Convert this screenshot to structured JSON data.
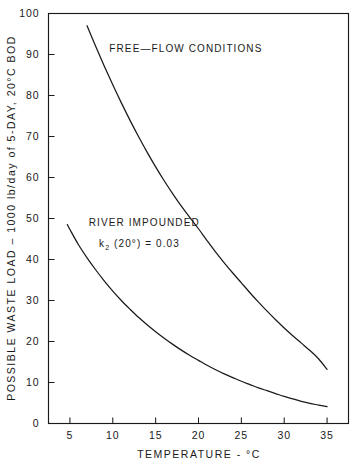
{
  "chart_data": {
    "type": "line",
    "title": "",
    "xlabel": "TEMPERATURE - °C",
    "ylabel": "POSSIBLE WASTE LOAD – 1000 lb/day of 5-DAY, 20°C BOD",
    "xlim": [
      2.5,
      37.5
    ],
    "ylim": [
      0,
      100
    ],
    "grid": false,
    "legend_position": "inline-annotations",
    "xticks": [
      5,
      10,
      15,
      20,
      25,
      30,
      35
    ],
    "xtick_labels": [
      "5",
      "10",
      "15",
      "20",
      "25",
      "30",
      "35"
    ],
    "yticks": [
      0,
      10,
      20,
      30,
      40,
      50,
      60,
      70,
      80,
      90,
      100
    ],
    "ytick_labels": [
      "0",
      "10",
      "20",
      "30",
      "40",
      "50",
      "60",
      "70",
      "80",
      "90",
      "100"
    ],
    "series": [
      {
        "name": "FREE-FLOW CONDITIONS",
        "x": [
          7,
          8,
          9,
          10,
          11,
          12,
          13,
          14,
          15,
          16,
          17,
          18,
          19,
          20,
          21,
          22,
          23,
          24,
          25,
          26,
          27,
          28,
          29,
          30,
          31,
          32,
          33,
          34,
          35
        ],
        "values": [
          97.0,
          92.0,
          87.2,
          82.6,
          78.2,
          74.0,
          70.0,
          66.2,
          62.6,
          59.2,
          56.0,
          53.0,
          50.2,
          47.5,
          44.6,
          41.8,
          39.2,
          36.7,
          34.3,
          31.9,
          29.6,
          27.4,
          25.3,
          23.3,
          21.4,
          19.6,
          17.8,
          15.8,
          13.2
        ]
      },
      {
        "name": "RIVER IMPOUNDED",
        "x": [
          4.7,
          5,
          6,
          7,
          8,
          9,
          10,
          11,
          12,
          13,
          14,
          15,
          16,
          17,
          18,
          19,
          20,
          21,
          22,
          23,
          24,
          25,
          26,
          27,
          28,
          29,
          30,
          31,
          32,
          33,
          34,
          35
        ],
        "values": [
          48.5,
          47.3,
          43.6,
          40.4,
          37.5,
          34.8,
          32.3,
          30.0,
          27.9,
          25.9,
          24.1,
          22.4,
          20.8,
          19.3,
          17.9,
          16.6,
          15.4,
          14.2,
          13.1,
          12.1,
          11.2,
          10.3,
          9.5,
          8.7,
          8.0,
          7.3,
          6.6,
          6.0,
          5.4,
          4.9,
          4.5,
          4.1
        ]
      }
    ],
    "annotations": [
      {
        "name": "free-flow-label",
        "text": "FREE—FLOW CONDITIONS",
        "x": 9.6,
        "y": 90.5
      },
      {
        "name": "river-impounded-label",
        "text": "RIVER IMPOUNDED",
        "x": 7.2,
        "y": 48.2
      },
      {
        "name": "k2-label",
        "text_prefix": "k",
        "text_subscript": "2",
        "text_suffix": " (20°) = 0.03",
        "x": 8.4,
        "y": 43.0
      }
    ]
  },
  "axes": {
    "x_title": "TEMPERATURE  -  °C",
    "y_title": "POSSIBLE  WASTE  LOAD  –  1000 lb/day of 5-DAY,  20°C  BOD"
  },
  "colors": {
    "ink": "#1a1a1a",
    "background": "#ffffff"
  }
}
